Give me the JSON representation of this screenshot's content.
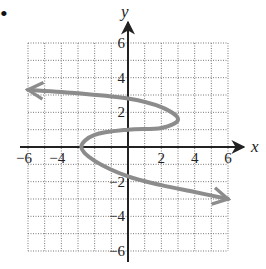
{
  "problem_marker": "•",
  "chart_data": {
    "type": "line",
    "title": "",
    "xlabel": "x",
    "ylabel": "y",
    "xlim": [
      -6,
      6
    ],
    "ylim": [
      -6,
      6
    ],
    "grid": true,
    "grid_style": "dotted",
    "grid_step": 1,
    "x_ticks": [
      -6,
      -4,
      2,
      4,
      6
    ],
    "y_ticks": [
      6,
      4,
      2,
      -2,
      -4,
      -6
    ],
    "x_tick_labels": [
      "−6",
      "−4",
      "2",
      "4",
      "6"
    ],
    "y_tick_labels": [
      "6",
      "4",
      "2",
      "−2",
      "−4",
      "−6"
    ],
    "curve_color": "#8c8c8c",
    "axis_color": "#222222",
    "series": [
      {
        "name": "curve",
        "description": "S-shaped relation (not a function of x), both ends with arrows",
        "points": [
          {
            "x": -6,
            "y": 3.3
          },
          {
            "x": -3,
            "y": 3.1
          },
          {
            "x": 0,
            "y": 2.8
          },
          {
            "x": 2,
            "y": 2.3
          },
          {
            "x": 3,
            "y": 1.6
          },
          {
            "x": 2,
            "y": 1.1
          },
          {
            "x": 0,
            "y": 1.0
          },
          {
            "x": -2,
            "y": 0.7
          },
          {
            "x": -2.8,
            "y": 0
          },
          {
            "x": -2,
            "y": -0.8
          },
          {
            "x": 0,
            "y": -1.7
          },
          {
            "x": 2,
            "y": -2.2
          },
          {
            "x": 4,
            "y": -2.6
          },
          {
            "x": 6,
            "y": -3.0
          }
        ],
        "arrow_start": true,
        "arrow_end": true
      }
    ]
  }
}
